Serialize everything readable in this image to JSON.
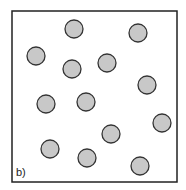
{
  "diagram": {
    "label": "b)",
    "box": {
      "x": 12,
      "y": 11,
      "width": 165,
      "height": 171,
      "stroke": "#222222"
    },
    "particle_fill": "#c8c8c8",
    "particle_stroke": "#333333",
    "particle_radius": 9,
    "particles": [
      {
        "cx": 74,
        "cy": 29
      },
      {
        "cx": 138,
        "cy": 33
      },
      {
        "cx": 36,
        "cy": 56
      },
      {
        "cx": 72,
        "cy": 69
      },
      {
        "cx": 107,
        "cy": 63
      },
      {
        "cx": 147,
        "cy": 85
      },
      {
        "cx": 46,
        "cy": 104
      },
      {
        "cx": 86,
        "cy": 102
      },
      {
        "cx": 162,
        "cy": 123
      },
      {
        "cx": 111,
        "cy": 134
      },
      {
        "cx": 50,
        "cy": 149
      },
      {
        "cx": 87,
        "cy": 158
      },
      {
        "cx": 140,
        "cy": 166
      }
    ]
  }
}
